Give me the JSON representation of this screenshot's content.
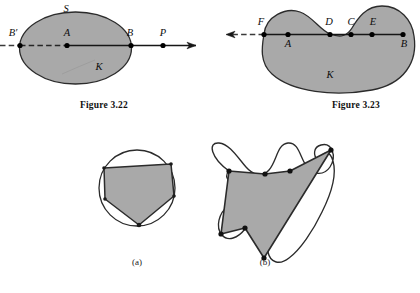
{
  "page": {
    "background": "#ffffff",
    "width": 420,
    "height": 293
  },
  "style": {
    "region_fill": "#a9a9a9",
    "region_stroke": "#2b2b2b",
    "line_color": "#161616",
    "dash_color": "#3a3a3a",
    "point_color": "#000000",
    "text_color": "#0d0d0d"
  },
  "figures": [
    {
      "id": "figure-3-22",
      "caption": "Figure 3.22",
      "region_label": "K",
      "boundary_label": "S",
      "shape": "ellipse",
      "description": "Convex ellipse K with boundary S cut by a horizontal line",
      "points": [
        {
          "name": "B'",
          "label": "B′",
          "x": 20,
          "y": 45,
          "position": "boundary-left"
        },
        {
          "name": "A",
          "label": "A",
          "x": 67,
          "y": 45,
          "position": "interior"
        },
        {
          "name": "B",
          "label": "B",
          "x": 131,
          "y": 45,
          "position": "boundary-right"
        },
        {
          "name": "P",
          "label": "P",
          "x": 163,
          "y": 45,
          "position": "exterior-right"
        }
      ],
      "arrow_direction": "right",
      "dashed_side": "left"
    },
    {
      "id": "figure-3-23",
      "caption": "Figure 3.23",
      "region_label": "K",
      "boundary_label": "",
      "shape": "kidney",
      "description": "Non-convex kidney region K with a concave notch crossed by a horizontal line",
      "points": [
        {
          "name": "F",
          "label": "F",
          "x": 264,
          "y": 34,
          "position": "boundary-left"
        },
        {
          "name": "A",
          "label": "A",
          "x": 288,
          "y": 34,
          "position": "interior"
        },
        {
          "name": "D",
          "label": "D",
          "x": 330,
          "y": 34,
          "position": "boundary-notch-left"
        },
        {
          "name": "C",
          "label": "C",
          "x": 351,
          "y": 34,
          "position": "exterior-notch"
        },
        {
          "name": "E",
          "label": "E",
          "x": 372,
          "y": 34,
          "position": "boundary-notch-right"
        },
        {
          "name": "B",
          "label": "B",
          "x": 403,
          "y": 34,
          "position": "interior-right"
        }
      ],
      "arrow_direction": "left",
      "dashed_side": "left"
    },
    {
      "id": "figure-3-24-a",
      "caption": "(a)",
      "shape": "pentagon-in-circle",
      "description": "Convex pentagon inscribed in a circle",
      "vertex_count": 5
    },
    {
      "id": "figure-3-24-b",
      "caption": "(b)",
      "shape": "polygon-in-wavy-curve",
      "description": "Non-convex polygon inscribed in a closed wavy curve",
      "vertex_count": 7
    }
  ],
  "captions": {
    "fig_322": "Figure 3.22",
    "fig_323": "Figure 3.23",
    "sub_a": "(a)",
    "sub_b": "(b)"
  },
  "labels": {
    "S": "S",
    "K": "K",
    "B_prime": "B′",
    "A": "A",
    "B": "B",
    "P": "P",
    "F": "F",
    "D": "D",
    "C": "C",
    "E": "E"
  }
}
